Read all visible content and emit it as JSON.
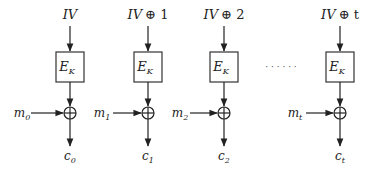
{
  "diagram": {
    "columns": [
      {
        "iv_label": "IV",
        "iv_suffix": "",
        "block_label": "E",
        "block_sub": "K",
        "message": "m",
        "message_sub": "0",
        "cipher": "c",
        "cipher_sub": "0"
      },
      {
        "iv_label": "IV",
        "iv_suffix": "⊕ 1",
        "block_label": "E",
        "block_sub": "K",
        "message": "m",
        "message_sub": "1",
        "cipher": "c",
        "cipher_sub": "1"
      },
      {
        "iv_label": "IV",
        "iv_suffix": "⊕ 2",
        "block_label": "E",
        "block_sub": "K",
        "message": "m",
        "message_sub": "2",
        "cipher": "c",
        "cipher_sub": "2"
      },
      {
        "iv_label": "IV",
        "iv_suffix": "⊕ t",
        "block_label": "E",
        "block_sub": "K",
        "message": "m",
        "message_sub": "t",
        "cipher": "c",
        "cipher_sub": "t"
      }
    ],
    "ellipsis": "· · · · · ·",
    "colors": {
      "stroke": "#222222",
      "background": "#ffffff"
    }
  }
}
